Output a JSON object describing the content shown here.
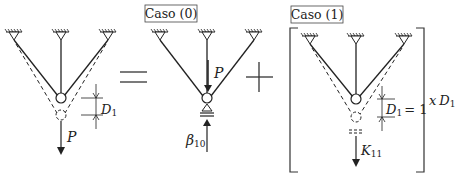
{
  "diagram": {
    "type": "structural-superposition",
    "operators": {
      "equals": "=",
      "plus": "+"
    },
    "panels": [
      {
        "id": "original",
        "labels": {
          "load": "P",
          "displacement_sym": "D",
          "displacement_sub": "1"
        }
      },
      {
        "id": "case0",
        "title": "Caso (0)",
        "labels": {
          "load": "P",
          "reaction_sym": "β",
          "reaction_sub": "10"
        }
      },
      {
        "id": "case1",
        "title": "Caso (1)",
        "labels": {
          "displacement_sym": "D",
          "displacement_sub": "1",
          "displacement_eq": "= 1",
          "stiffness_sym": "K",
          "stiffness_sub": "11",
          "multiplier_prefix": "x",
          "multiplier_sym": "D",
          "multiplier_sub": "1"
        }
      }
    ],
    "colors": {
      "line": "#222222",
      "box": "#444444",
      "background": "#ffffff"
    }
  }
}
